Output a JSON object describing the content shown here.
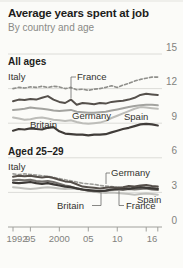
{
  "header": {
    "title": "Average years spent at job",
    "subtitle": "By country and age"
  },
  "colors": {
    "background": "#fbfbf8",
    "title_text": "#1d1d1b",
    "subtitle_text": "#8a8a86",
    "gridline": "#dcdcd8",
    "axis": "#a0a09c",
    "axis_label": "#82827e",
    "annotation_text": "#33332f",
    "leader_line": "#6b6b67"
  },
  "chart_data": {
    "type": "line",
    "title": "Average years spent at job",
    "subtitle": "By country and age",
    "x_range": [
      1992,
      2017
    ],
    "ylim": [
      0,
      15
    ],
    "grid": "on",
    "legend_position": "direct-labels-on-chart",
    "y_axis": {
      "side": "right",
      "ticks": [
        0,
        3,
        6,
        9,
        12,
        15
      ],
      "labels": [
        "0",
        "3",
        "6",
        "9",
        "12",
        "15"
      ]
    },
    "x_axis": {
      "ticks": [
        1992,
        1995,
        2000,
        2005,
        2010,
        2015,
        2017
      ],
      "labels": [
        {
          "text": "1992",
          "year": 1992.7
        },
        {
          "text": "95",
          "year": 1995
        },
        {
          "text": "2000",
          "year": 2000
        },
        {
          "text": "05",
          "year": 2005
        },
        {
          "text": "10",
          "year": 2010
        },
        {
          "text": "16",
          "year": 2016
        }
      ]
    },
    "years_start": 1992,
    "panels": [
      {
        "label": "All ages",
        "series": [
          {
            "name": "Germany",
            "color": "#a3a39f",
            "width": 2,
            "dashed": false,
            "values": [
              10.15,
              10.2,
              10.25,
              10.35,
              10.3,
              10.25,
              10.2,
              10.1,
              10.05,
              10.1,
              10.15,
              10.0,
              9.95,
              9.9,
              9.9,
              9.95,
              10.0,
              10.1,
              10.2,
              10.3,
              10.4,
              10.5,
              10.55,
              10.6,
              10.6,
              10.55
            ]
          },
          {
            "name": "Spain",
            "color": "#bdbdb9",
            "width": 2,
            "dashed": false,
            "values": [
              9.5,
              9.4,
              9.3,
              9.35,
              9.45,
              9.5,
              9.4,
              9.3,
              9.25,
              9.2,
              9.25,
              9.1,
              9.0,
              8.95,
              9.0,
              9.05,
              9.2,
              9.45,
              9.65,
              9.85,
              10.05,
              10.25,
              10.4,
              10.35,
              10.3,
              10.25
            ]
          },
          {
            "name": "Britain",
            "color": "#403c39",
            "width": 2.2,
            "dashed": false,
            "values": [
              8.35,
              8.5,
              8.45,
              8.55,
              8.5,
              8.45,
              8.6,
              8.65,
              8.3,
              8.1,
              8.05,
              8.0,
              8.0,
              7.95,
              8.0,
              8.0,
              8.05,
              8.2,
              8.35,
              8.5,
              8.6,
              8.75,
              8.9,
              8.95,
              8.9,
              8.8
            ]
          },
          {
            "name": "Italy",
            "color": "#8f8f8b",
            "width": 1.6,
            "dashed": true,
            "values": [
              12.0,
              12.1,
              12.05,
              12.15,
              12.1,
              12.2,
              12.1,
              12.2,
              12.15,
              12.0,
              12.1,
              11.9,
              11.95,
              11.85,
              11.95,
              12.0,
              12.1,
              12.25,
              12.1,
              12.3,
              12.45,
              12.65,
              12.8,
              12.9,
              13.0,
              13.0
            ]
          },
          {
            "name": "France",
            "color": "#55504b",
            "width": 2,
            "dashed": false,
            "values": [
              10.9,
              11.05,
              11.0,
              11.1,
              11.05,
              11.2,
              11.35,
              11.05,
              10.85,
              10.75,
              11.05,
              10.6,
              10.75,
              10.7,
              10.65,
              10.75,
              10.7,
              10.85,
              10.9,
              10.95,
              11.05,
              11.2,
              11.45,
              11.55,
              11.5,
              11.45
            ]
          }
        ]
      },
      {
        "label": "Aged 25–29",
        "series": [
          {
            "name": "Spain",
            "color": "#c0c0bc",
            "width": 2,
            "dashed": false,
            "values": [
              3.45,
              3.4,
              3.35,
              3.3,
              3.35,
              3.4,
              3.45,
              3.4,
              3.35,
              3.3,
              3.35,
              3.3,
              3.25,
              3.15,
              3.05,
              3.0,
              2.95,
              3.0,
              2.95,
              2.9,
              2.85,
              2.8,
              2.85,
              2.9,
              2.85,
              2.8
            ]
          },
          {
            "name": "Germany",
            "color": "#9c9c98",
            "width": 1.6,
            "dashed": true,
            "values": [
              4.6,
              4.55,
              4.6,
              4.55,
              4.5,
              4.45,
              4.4,
              4.3,
              4.2,
              4.1,
              4.0,
              3.9,
              3.8,
              3.75,
              3.7,
              3.6,
              3.55,
              3.5,
              3.45,
              3.4,
              3.4,
              3.35,
              3.4,
              3.45,
              3.4,
              3.35
            ]
          },
          {
            "name": "France",
            "color": "#73706c",
            "width": 2,
            "dashed": false,
            "values": [
              4.05,
              4.1,
              4.05,
              4.1,
              4.0,
              3.95,
              4.0,
              3.9,
              3.75,
              3.6,
              3.5,
              3.35,
              3.25,
              3.15,
              3.1,
              3.1,
              3.15,
              3.2,
              3.25,
              3.2,
              3.3,
              3.25,
              3.3,
              3.35,
              3.25,
              3.2
            ]
          },
          {
            "name": "Britain",
            "color": "#3c3936",
            "width": 2.2,
            "dashed": false,
            "values": [
              3.85,
              3.8,
              3.85,
              3.9,
              3.8,
              3.75,
              3.8,
              3.7,
              3.6,
              3.5,
              3.45,
              3.35,
              3.25,
              3.2,
              3.15,
              3.1,
              3.15,
              3.25,
              3.3,
              3.35,
              3.3,
              3.4,
              3.45,
              3.4,
              3.35,
              3.3
            ]
          },
          {
            "name": "Italy",
            "color": "#554f4a",
            "width": 2,
            "dashed": false,
            "values": [
              4.35,
              4.45,
              4.4,
              4.45,
              4.35,
              4.3,
              4.35,
              4.25,
              4.1,
              3.95,
              3.9,
              3.7,
              3.5,
              3.45,
              3.4,
              3.35,
              3.4,
              3.45,
              3.4,
              3.45,
              3.55,
              3.5,
              3.6,
              3.65,
              3.55,
              3.5
            ]
          }
        ]
      }
    ],
    "annotations": [
      {
        "id": "panel-label-all-ages",
        "text": "All ages",
        "x": 8,
        "y": 63,
        "bold": true
      },
      {
        "id": "label-italy-all-ages",
        "text": "Italy",
        "x": 8,
        "y": 78,
        "bold": false
      },
      {
        "id": "label-france-all-ages",
        "text": "France",
        "x": 77,
        "y": 78,
        "bold": false,
        "leader": "M76,75 H71 V96"
      },
      {
        "id": "label-germany-all-ages",
        "text": "Germany",
        "x": 72,
        "y": 117,
        "bold": false
      },
      {
        "id": "label-spain-all-ages",
        "text": "Spain",
        "x": 124,
        "y": 118,
        "bold": false
      },
      {
        "id": "label-britain-all-ages",
        "text": "Britain",
        "x": 30,
        "y": 126,
        "bold": false
      },
      {
        "id": "panel-label-aged-25-29",
        "text": "Aged 25–29",
        "x": 8,
        "y": 153,
        "bold": true
      },
      {
        "id": "label-italy-aged-25-29",
        "text": "Italy",
        "x": 8,
        "y": 168,
        "bold": false
      },
      {
        "id": "label-germany-aged-25-29",
        "text": "Germany",
        "x": 111,
        "y": 174,
        "bold": false,
        "leader": "M110,171 H106 V182"
      },
      {
        "id": "label-britain-aged-25-29",
        "text": "Britain",
        "x": 57,
        "y": 207,
        "bold": false,
        "leader": "M92,203.5 H101 V191"
      },
      {
        "id": "label-france-aged-25-29",
        "text": "France",
        "x": 126,
        "y": 207,
        "bold": false,
        "leader": "M124,203.5 H119 V189"
      },
      {
        "id": "label-spain-aged-25-29",
        "text": "Spain",
        "x": 137,
        "y": 201,
        "bold": false
      }
    ]
  }
}
